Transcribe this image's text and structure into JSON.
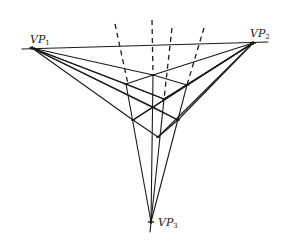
{
  "diagram": {
    "colors": {
      "line": "#1a1a1a",
      "background": "#ffffff"
    },
    "vanishing_points": [
      {
        "id": "vp1",
        "label": "VP",
        "sub": "1",
        "x": 32,
        "y": 48
      },
      {
        "id": "vp2",
        "label": "VP",
        "sub": "2",
        "x": 253,
        "y": 43
      },
      {
        "id": "vp3",
        "label": "VP",
        "sub": "3",
        "x": 151,
        "y": 222
      }
    ],
    "horizon": {
      "x1": 22,
      "y1": 49,
      "x2": 268,
      "y2": 42
    },
    "cube_vertices": {
      "top": [
        153,
        75
      ],
      "upper_left": [
        126,
        84
      ],
      "upper_right": [
        187,
        85
      ],
      "inner": [
        164,
        99
      ],
      "lower_left": [
        133,
        120
      ],
      "lower_right": [
        178,
        120
      ],
      "bottom": [
        158,
        137
      ],
      "cross": [
        153,
        107
      ]
    },
    "dashed_lines": [
      {
        "x1": 115,
        "y1": 24,
        "x2": 128,
        "y2": 84
      },
      {
        "x1": 152,
        "y1": 20,
        "x2": 153,
        "y2": 75
      },
      {
        "x1": 172,
        "y1": 28,
        "x2": 164,
        "y2": 99
      },
      {
        "x1": 204,
        "y1": 28,
        "x2": 187,
        "y2": 85
      }
    ]
  }
}
